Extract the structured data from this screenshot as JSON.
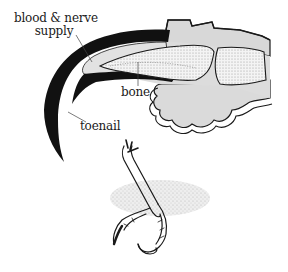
{
  "diagram": {
    "labels": {
      "blood_nerve_line1": "blood & nerve",
      "blood_nerve_line2": "supply",
      "bone": "bone",
      "toenail": "toenail"
    },
    "colors": {
      "nail": "#111111",
      "quick": "#e2e2e2",
      "bone_fill": "#f2f2f2",
      "tissue": "#dcdcdc",
      "outline": "#1a1a1a",
      "stipple": "#9a9a9a"
    }
  }
}
